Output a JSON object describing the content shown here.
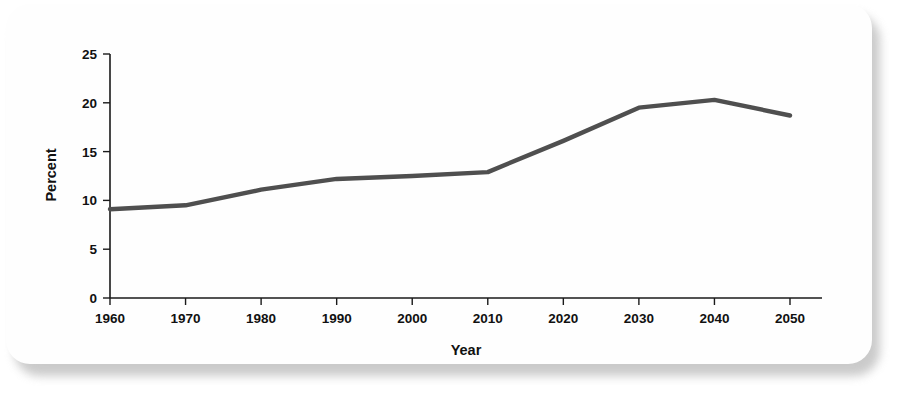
{
  "card": {
    "background_color": "#fefefe",
    "shadow_color": "#b9b9b9"
  },
  "chart_data": {
    "type": "line",
    "title": "",
    "subtitle": "",
    "xlabel": "Year",
    "ylabel": "Percent",
    "categories": [
      "1960",
      "1970",
      "1980",
      "1990",
      "2000",
      "2010",
      "2020",
      "2030",
      "2040",
      "2050"
    ],
    "x": [
      1960,
      1970,
      1980,
      1990,
      2000,
      2010,
      2020,
      2030,
      2040,
      2050
    ],
    "values": [
      9.1,
      9.5,
      11.1,
      12.2,
      12.5,
      12.9,
      16.1,
      19.5,
      20.3,
      18.7
    ],
    "series": [
      {
        "name": "Percent",
        "color": "#4f4f4f",
        "values": [
          9.1,
          9.5,
          11.1,
          12.2,
          12.5,
          12.9,
          16.1,
          19.5,
          20.3,
          18.7
        ]
      }
    ],
    "xlim": [
      1960,
      2050
    ],
    "ylim": [
      0,
      25
    ],
    "yticks": [
      0,
      5,
      10,
      15,
      20,
      25
    ],
    "ytick_labels": [
      "0",
      "5",
      "10",
      "15",
      "20",
      "25"
    ],
    "xticks": [
      1960,
      1970,
      1980,
      1990,
      2000,
      2010,
      2020,
      2030,
      2040,
      2050
    ],
    "xtick_labels": [
      "1960",
      "1970",
      "1980",
      "1990",
      "2000",
      "2010",
      "2020",
      "2030",
      "2040",
      "2050"
    ],
    "grid": false,
    "legend": false,
    "legend_position": "none",
    "line_color": "#4f4f4f",
    "axis_color": "#1a1a1a"
  }
}
